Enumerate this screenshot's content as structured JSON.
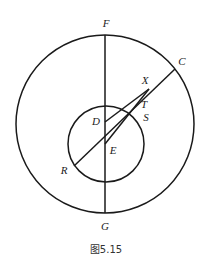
{
  "figure": {
    "caption": "图5.15",
    "shapes": [
      {
        "kind": "circle",
        "name": "outer-circle"
      },
      {
        "kind": "circle",
        "name": "inner-circle"
      }
    ],
    "segments": [
      {
        "from": "F",
        "to": "G"
      },
      {
        "from": "R",
        "to": "C"
      },
      {
        "from": "D",
        "to": "X"
      },
      {
        "from": "E",
        "to": "X"
      }
    ],
    "points": {
      "F": "F",
      "C": "C",
      "X": "X",
      "T": "T",
      "D": "D",
      "S": "S",
      "E": "E",
      "R": "R",
      "G": "G"
    }
  }
}
